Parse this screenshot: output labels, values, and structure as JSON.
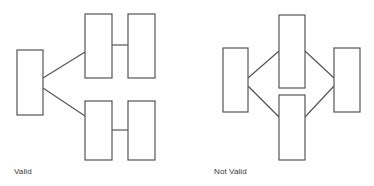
{
  "page": {
    "background_color": "#ffffff",
    "stroke_color": "#555555",
    "text_color": "#3a3a3a",
    "width": 374,
    "height": 186
  },
  "diagrams": [
    {
      "id": "valid",
      "caption": "Valid",
      "nodes": [
        {
          "id": "v-left",
          "name": "left-node",
          "x": 17,
          "y": 50,
          "w": 26,
          "h": 65
        },
        {
          "id": "v-top-mid",
          "name": "top-middle-node",
          "x": 85,
          "y": 14,
          "w": 27,
          "h": 64
        },
        {
          "id": "v-top-right",
          "name": "top-right-node",
          "x": 128,
          "y": 14,
          "w": 27,
          "h": 64
        },
        {
          "id": "v-bot-mid",
          "name": "bottom-middle-node",
          "x": 85,
          "y": 101,
          "w": 27,
          "h": 59
        },
        {
          "id": "v-bot-right",
          "name": "bottom-right-node",
          "x": 128,
          "y": 101,
          "w": 27,
          "h": 59
        }
      ],
      "edges": [
        {
          "id": "v-e1",
          "name": "left-to-top-middle-edge",
          "x1": 43,
          "y1": 78,
          "x2": 85,
          "y2": 52
        },
        {
          "id": "v-e2",
          "name": "left-to-bottom-middle-edge",
          "x1": 43,
          "y1": 88,
          "x2": 85,
          "y2": 116
        },
        {
          "id": "v-e3",
          "name": "top-row-connector-edge",
          "x1": 112,
          "y1": 45,
          "x2": 128,
          "y2": 45
        },
        {
          "id": "v-e4",
          "name": "bottom-row-connector-edge",
          "x1": 112,
          "y1": 130,
          "x2": 128,
          "y2": 130
        }
      ]
    },
    {
      "id": "not-valid",
      "caption": "Not Valid",
      "nodes": [
        {
          "id": "n-left",
          "name": "left-node",
          "x": 223,
          "y": 48,
          "w": 25,
          "h": 64
        },
        {
          "id": "n-top-mid",
          "name": "top-middle-node",
          "x": 279,
          "y": 15,
          "w": 26,
          "h": 73
        },
        {
          "id": "n-bot-mid",
          "name": "bottom-middle-node",
          "x": 279,
          "y": 95,
          "w": 26,
          "h": 65
        },
        {
          "id": "n-right",
          "name": "right-node",
          "x": 334,
          "y": 48,
          "w": 26,
          "h": 64
        }
      ],
      "edges": [
        {
          "id": "n-e1",
          "name": "left-to-top-middle-edge",
          "x1": 248,
          "y1": 78,
          "x2": 279,
          "y2": 51
        },
        {
          "id": "n-e2",
          "name": "left-to-bottom-middle-edge",
          "x1": 248,
          "y1": 86,
          "x2": 279,
          "y2": 117
        },
        {
          "id": "n-e3",
          "name": "top-middle-to-right-edge",
          "x1": 305,
          "y1": 51,
          "x2": 334,
          "y2": 78
        },
        {
          "id": "n-e4",
          "name": "bottom-middle-to-right-edge",
          "x1": 305,
          "y1": 117,
          "x2": 334,
          "y2": 86
        }
      ]
    }
  ]
}
